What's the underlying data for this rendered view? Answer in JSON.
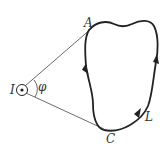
{
  "diagram": {
    "current": {
      "label": "I",
      "symbol": "current-out-of-page"
    },
    "angle": {
      "label": "φ"
    },
    "points": {
      "A": {
        "label": "A"
      },
      "C": {
        "label": "C"
      }
    },
    "loop": {
      "label": "L"
    },
    "colors": {
      "stroke": "#222222",
      "label": "#333333",
      "background": "#ffffff"
    }
  }
}
